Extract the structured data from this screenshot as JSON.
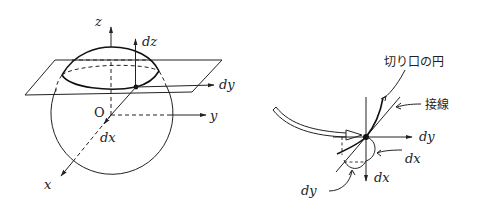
{
  "left_diagram": {
    "title": "sphere cut by horizontal plane",
    "labels": {
      "z_axis": "z",
      "dz": "dz",
      "dy_on_plane": "dy",
      "y_axis": "y",
      "origin": "O",
      "dx": "dx",
      "x_axis": "x"
    }
  },
  "transition_arrow": {
    "icon": "hollow-curved-arrow-icon"
  },
  "right_diagram": {
    "title": "enlarged view near the point",
    "labels": {
      "cut_circle": "切り口の円",
      "tangent": "接線",
      "dy_axis": "dy",
      "dx_curve": "dx",
      "dx_axis": "dx",
      "dy_curve": "dy"
    }
  },
  "colors": {
    "ink": "#222222",
    "background": "#ffffff"
  }
}
